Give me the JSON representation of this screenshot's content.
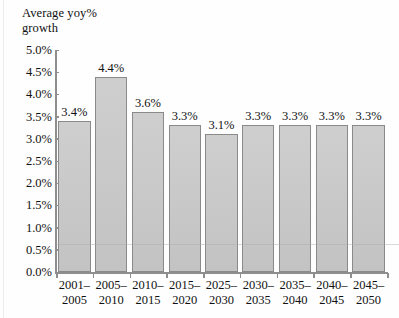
{
  "chart_data": {
    "type": "bar",
    "title": "",
    "ylabel": "Average yoy%\ngrowth",
    "xlabel": "",
    "ylim": [
      0.0,
      5.0
    ],
    "ytick_labels": [
      "5.0%",
      "4.5%",
      "4.0%",
      "3.5%",
      "3.0%",
      "2.5%",
      "2.0%",
      "1.5%",
      "1.0%",
      "0.5%",
      "0.0%"
    ],
    "ytick_values": [
      5.0,
      4.5,
      4.0,
      3.5,
      3.0,
      2.5,
      2.0,
      1.5,
      1.0,
      0.5,
      0.0
    ],
    "grid": false,
    "legend": null,
    "categories": [
      "2001–\n2005",
      "2005–\n2010",
      "2010–\n2015",
      "2015–\n2020",
      "2025–\n2030",
      "2030–\n2035",
      "2035–\n2040",
      "2040–\n2045",
      "2045–\n2050"
    ],
    "values": [
      3.4,
      4.4,
      3.6,
      3.3,
      3.1,
      3.3,
      3.3,
      3.3,
      3.3
    ],
    "data_labels": [
      "3.4%",
      "4.4%",
      "3.6%",
      "3.3%",
      "3.1%",
      "3.3%",
      "3.3%",
      "3.3%",
      "3.3%"
    ],
    "bar_color": "#c9c9c9",
    "bar_border_color": "#8a8a8a",
    "axis_color": "#8e8e8e"
  }
}
